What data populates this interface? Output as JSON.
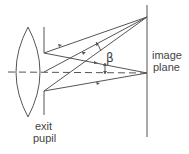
{
  "diagram": {
    "labels": {
      "image_plane_line1": "image",
      "image_plane_line2": "plane",
      "exit_pupil_line1": "exit",
      "exit_pupil_line2": "pupil",
      "angle": "β"
    },
    "elements": [
      "lens",
      "exit-pupil-stop",
      "optical-axis",
      "image-plane",
      "ray-bundle-off-axis",
      "ray-bundle-on-axis",
      "angle-beta"
    ],
    "colors": {
      "stroke": "#555555",
      "text": "#444444",
      "background": "#ffffff"
    }
  }
}
